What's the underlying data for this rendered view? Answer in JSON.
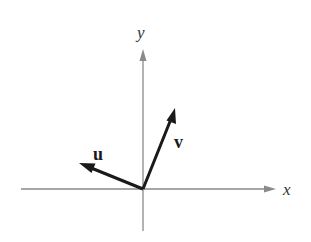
{
  "diagram": {
    "title": "",
    "axes": {
      "x": {
        "label": "x"
      },
      "y": {
        "label": "y"
      }
    },
    "vectors": [
      {
        "name": "u",
        "label": "u",
        "direction": "up-left"
      },
      {
        "name": "v",
        "label": "v",
        "direction": "up-right"
      }
    ],
    "colors": {
      "axis": "#8a8a8a",
      "vector": "#1a1a1a",
      "background": "#ffffff"
    }
  }
}
